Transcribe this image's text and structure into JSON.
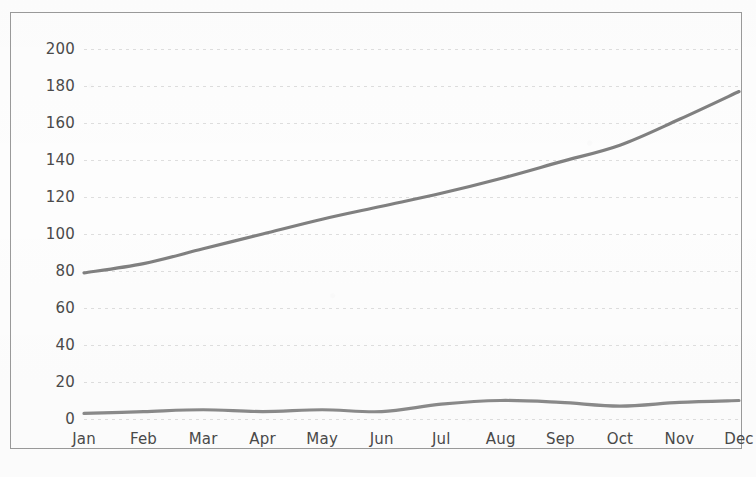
{
  "chart_data": {
    "type": "line",
    "title": "",
    "subtitle": "",
    "xlabel": "",
    "ylabel": "",
    "categories": [
      "Jan",
      "Feb",
      "Mar",
      "Apr",
      "May",
      "Jun",
      "Jul",
      "Aug",
      "Sep",
      "Oct",
      "Nov",
      "Dec"
    ],
    "series": [
      {
        "name": "upper-series",
        "color": "#808080",
        "values": [
          79,
          84,
          92,
          100,
          108,
          115,
          122,
          130,
          139,
          148,
          162,
          177
        ]
      },
      {
        "name": "lower-series",
        "color": "#8a8a8a",
        "values": [
          3,
          4,
          5,
          4,
          5,
          4,
          8,
          10,
          9,
          7,
          9,
          10
        ]
      }
    ],
    "ylim": [
      0,
      200
    ],
    "ytick_step": 20,
    "yticks": [
      0,
      20,
      40,
      60,
      80,
      100,
      120,
      140,
      160,
      180,
      200
    ],
    "ytick_labels": [
      "0",
      "20",
      "40",
      "60",
      "80",
      "100",
      "120",
      "140",
      "160",
      "180",
      "200"
    ],
    "grid": true,
    "grid_axis": "y",
    "legend": false,
    "legend_position": "none",
    "annotations": []
  },
  "colors": {
    "frame": "#9a9a9a",
    "gridline": "#bdbdbd",
    "tick_text": "#4a4a4a",
    "background": "#fdfdfd",
    "series_upper": "#808080",
    "series_lower": "#8a8a8a"
  }
}
